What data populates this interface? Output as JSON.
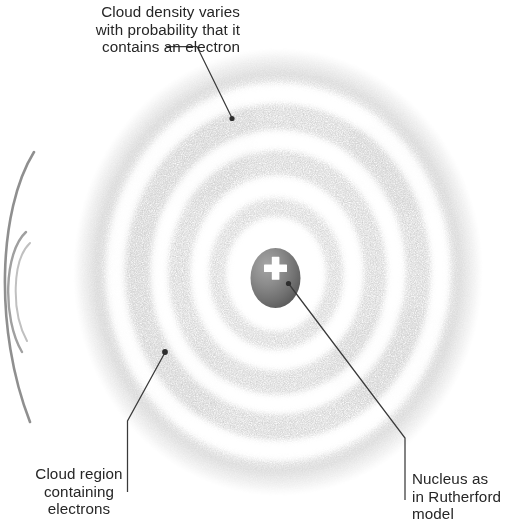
{
  "figure": {
    "type": "scientific-diagram",
    "background_color": "#ffffff",
    "ink_color": "#262626",
    "cloud_color": "#8f8f8f",
    "nucleus_color": "#6e6e6e",
    "orbit_arc_color": "#8a8a8a"
  },
  "labels": {
    "density": {
      "lines": [
        "Cloud density varies",
        "with probability that it",
        "contains an electron"
      ],
      "text": "Cloud density varies\nwith probability that it\ncontains an electron",
      "align": "right",
      "leader": "elbow-line-with-dot"
    },
    "region": {
      "lines": [
        "Cloud region",
        "containing",
        "electrons"
      ],
      "text": "Cloud region\ncontaining\nelectrons",
      "align": "center",
      "leader": "elbow-line-with-dot"
    },
    "nucleus": {
      "lines": [
        "Nucleus as",
        "in Rutherford",
        "model"
      ],
      "text": "Nucleus as\nin Rutherford\nmodel",
      "align": "left",
      "leader": "elbow-line-with-dot"
    }
  },
  "nucleus": {
    "charge_symbol": "+",
    "shape": "ellipse",
    "center_x": 275,
    "center_y": 278,
    "radius_x": 25,
    "radius_y": 30
  },
  "cloud": {
    "center_x": 278,
    "center_y": 272,
    "radius_x": 200,
    "radius_y": 218,
    "ring_count": 5,
    "description": "concentric stippled probability shells"
  },
  "side_orbits": {
    "count": 2,
    "description": "partial arcs of an adjacent Bohr-model diagram at the left edge"
  }
}
